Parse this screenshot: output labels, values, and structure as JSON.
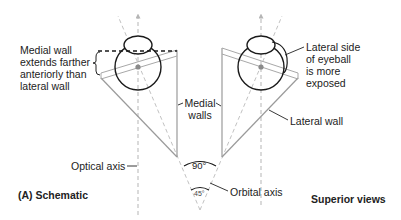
{
  "figure": {
    "panel_label": "(A) Schematic",
    "view_label": "Superior views"
  },
  "annotations": {
    "medial_wall_note": "Medial wall\nextends farther\nanteriorly than\nlateral wall",
    "lateral_side_note": "Lateral side\nof eyeball\nis more\nexposed",
    "medial_walls": "Medial\nwalls",
    "lateral_wall": "Lateral wall",
    "optical_axis": "Optical axis",
    "orbital_axis": "Orbital axis",
    "angle_90": "90°",
    "angle_45": "45°"
  },
  "colors": {
    "outline": "#1a1a1a",
    "wall": "#9a9a9a",
    "axis": "#b5b5b5",
    "text": "#222222"
  }
}
